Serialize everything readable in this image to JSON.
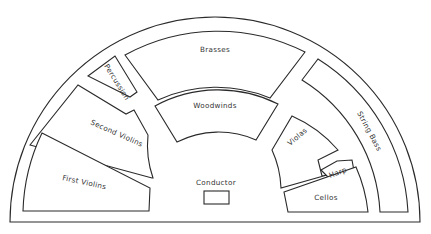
{
  "diagram": {
    "type": "orchestra-seating-plan",
    "colors": {
      "stroke": "#2a2a2a",
      "text": "#333333",
      "background": "#ffffff"
    },
    "sections": {
      "brasses": "Brasses",
      "percussion": "Percussion",
      "woodwinds": "Woodwinds",
      "second_violins": "Second Violins",
      "first_violins": "First Violins",
      "violas": "Violas",
      "harp": "Harp",
      "string_bass": "String Bass",
      "cellos": "Cellos",
      "conductor": "Conductor"
    }
  }
}
